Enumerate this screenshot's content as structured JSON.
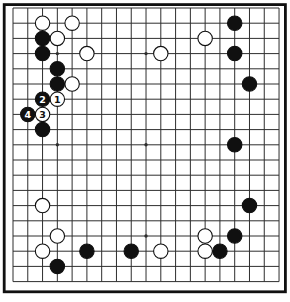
{
  "diagram": {
    "type": "go-board-diagram",
    "board_size": 19,
    "colors": {
      "background": "#ffffff",
      "grid_line": "#2e2e2e",
      "frame": "#101010",
      "black_stone": "#101010",
      "white_stone": "#ffffff",
      "stone_outline": "#101010",
      "number_on_black": "#ffffff",
      "number_on_white": "#101010"
    },
    "layout": {
      "grid_origin_x": 13,
      "grid_origin_y": 8,
      "col_spacing": 14.78,
      "row_spacing": 15.2,
      "stone_radius": 7.2,
      "star_radius": 1.7,
      "frame": {
        "x": 4.2,
        "y": 4.6,
        "width": 281.2,
        "height": 287.2,
        "stroke_width": 2.8
      }
    },
    "star_points": [
      [
        4,
        4
      ],
      [
        10,
        4
      ],
      [
        16,
        4
      ],
      [
        4,
        10
      ],
      [
        10,
        10
      ],
      [
        16,
        10
      ],
      [
        4,
        16
      ],
      [
        10,
        16
      ],
      [
        16,
        16
      ]
    ],
    "stones": [
      {
        "col": 3,
        "row": 2,
        "color": "white"
      },
      {
        "col": 5,
        "row": 2,
        "color": "white"
      },
      {
        "col": 4,
        "row": 3,
        "color": "white"
      },
      {
        "col": 14,
        "row": 3,
        "color": "white"
      },
      {
        "col": 6,
        "row": 4,
        "color": "white"
      },
      {
        "col": 11,
        "row": 4,
        "color": "white"
      },
      {
        "col": 5,
        "row": 6,
        "color": "white"
      },
      {
        "col": 3,
        "row": 14,
        "color": "white"
      },
      {
        "col": 4,
        "row": 16,
        "color": "white"
      },
      {
        "col": 14,
        "row": 16,
        "color": "white"
      },
      {
        "col": 3,
        "row": 17,
        "color": "white"
      },
      {
        "col": 11,
        "row": 17,
        "color": "white"
      },
      {
        "col": 14,
        "row": 17,
        "color": "white"
      },
      {
        "col": 3,
        "row": 3,
        "color": "black"
      },
      {
        "col": 3,
        "row": 4,
        "color": "black"
      },
      {
        "col": 16,
        "row": 2,
        "color": "black"
      },
      {
        "col": 16,
        "row": 4,
        "color": "black"
      },
      {
        "col": 4,
        "row": 5,
        "color": "black"
      },
      {
        "col": 4,
        "row": 6,
        "color": "black"
      },
      {
        "col": 17,
        "row": 6,
        "color": "black"
      },
      {
        "col": 3,
        "row": 9,
        "color": "black"
      },
      {
        "col": 16,
        "row": 10,
        "color": "black"
      },
      {
        "col": 17,
        "row": 14,
        "color": "black"
      },
      {
        "col": 16,
        "row": 16,
        "color": "black"
      },
      {
        "col": 6,
        "row": 17,
        "color": "black"
      },
      {
        "col": 9,
        "row": 17,
        "color": "black"
      },
      {
        "col": 15,
        "row": 17,
        "color": "black"
      },
      {
        "col": 4,
        "row": 18,
        "color": "black"
      },
      {
        "col": 4,
        "row": 7,
        "color": "white",
        "label": "1"
      },
      {
        "col": 3,
        "row": 7,
        "color": "black",
        "label": "2"
      },
      {
        "col": 3,
        "row": 8,
        "color": "white",
        "label": "3"
      },
      {
        "col": 2,
        "row": 8,
        "color": "black",
        "label": "4"
      }
    ]
  }
}
